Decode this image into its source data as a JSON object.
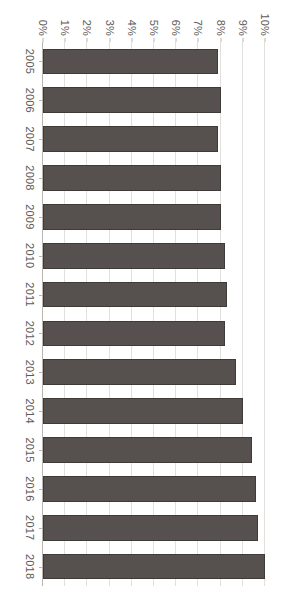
{
  "chart_data": {
    "type": "bar",
    "orientation": "rotated-90",
    "title": "",
    "xlabel": "",
    "ylabel": "",
    "categories": [
      "2005",
      "2006",
      "2007",
      "2008",
      "2009",
      "2010",
      "2011",
      "2012",
      "2013",
      "2014",
      "2015",
      "2016",
      "2017",
      "2018"
    ],
    "values": [
      7.9,
      8.0,
      7.9,
      8.0,
      8.0,
      8.2,
      8.3,
      8.2,
      8.7,
      9.0,
      9.4,
      9.6,
      9.7,
      10.0
    ],
    "value_tick_labels": [
      "10%",
      "9%",
      "8%",
      "7%",
      "6%",
      "5%",
      "4%",
      "3%",
      "2%",
      "1%",
      "0%"
    ],
    "value_ticks": [
      10,
      9,
      8,
      7,
      6,
      5,
      4,
      3,
      2,
      1,
      0
    ],
    "ylim": [
      0,
      10
    ],
    "grid": true,
    "legend": "none",
    "series": [
      {
        "name": "",
        "values": [
          7.9,
          8.0,
          7.9,
          8.0,
          8.0,
          8.2,
          8.3,
          8.2,
          8.7,
          9.0,
          9.4,
          9.6,
          9.7,
          10.0
        ]
      }
    ]
  },
  "style": {
    "bar_color": "#56514e",
    "bar_border_color": "#3f3b39",
    "grid_color": "#e2e0dd",
    "axis_color": "#b9b5b0",
    "text_color": "#5d5a57",
    "background": "#ffffff"
  }
}
